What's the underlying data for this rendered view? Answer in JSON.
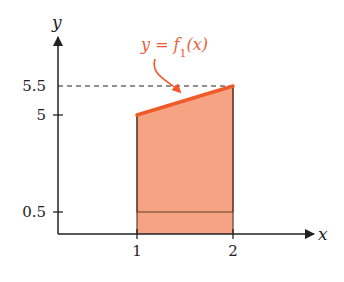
{
  "colors": {
    "fill": "#F5A383",
    "function_line": "#F05A28",
    "label": "#E8603A",
    "axis": "#222222",
    "edge": "#6b3a2a"
  },
  "chart_data": {
    "type": "area",
    "xlabel": "x",
    "ylabel": "y",
    "x_ticks": [
      {
        "value": 1,
        "label": "1"
      },
      {
        "value": 2,
        "label": "2"
      }
    ],
    "y_ticks": [
      {
        "value": 0.5,
        "label": "0.5"
      },
      {
        "value": 5,
        "label": "5"
      },
      {
        "value": 5.5,
        "label": "5.5"
      }
    ],
    "function": {
      "label": "y = f1(x)",
      "label_text": "y = f",
      "label_subscript": "1",
      "label_suffix": "(x)",
      "points": [
        [
          1,
          5
        ],
        [
          2,
          5.5
        ]
      ]
    },
    "shaded_region": {
      "x_from": 1,
      "x_to": 2,
      "y_bottom": 0,
      "y_top": "f1(x)"
    },
    "inner_rectangle": {
      "x_from": 1,
      "x_to": 2,
      "y_from": 0.5,
      "y_to": 5
    },
    "dashed_reference": {
      "y": 5.5,
      "x_from": 0,
      "x_to": 2
    }
  }
}
